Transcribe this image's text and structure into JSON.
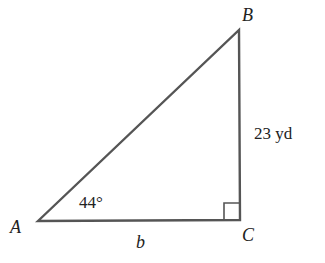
{
  "figure": {
    "type": "right-triangle",
    "vertices": {
      "A": {
        "label": "A",
        "x": 38,
        "y": 221
      },
      "B": {
        "label": "B",
        "x": 239,
        "y": 30
      },
      "C": {
        "label": "C",
        "x": 240,
        "y": 220
      }
    },
    "angle_A": "44°",
    "side_BC": "23 yd",
    "side_AC": "b",
    "right_angle_at": "C",
    "stroke_color": "#555555"
  }
}
